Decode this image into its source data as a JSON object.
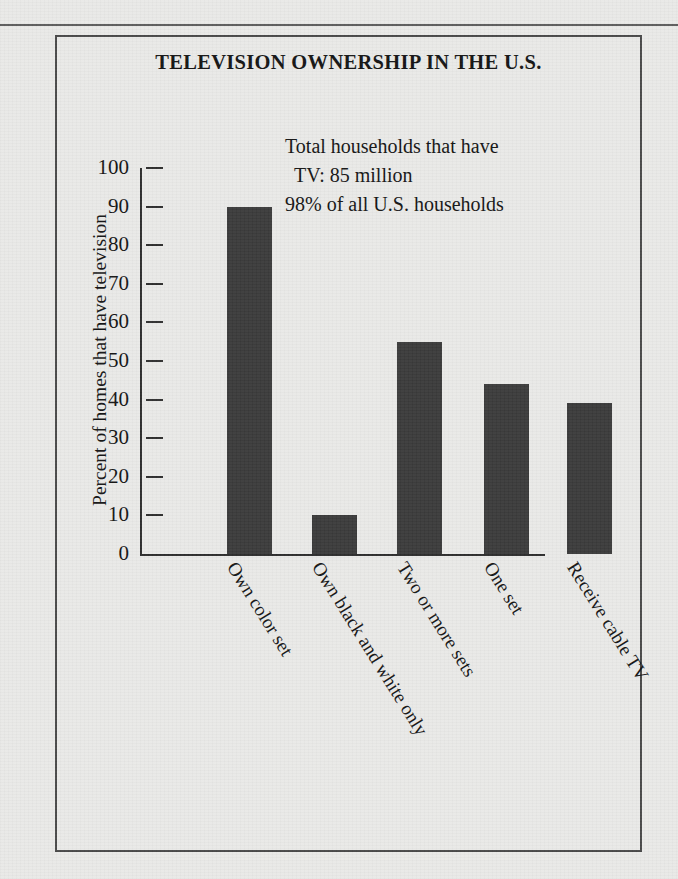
{
  "figure": {
    "title": "TELEVISION OWNERSHIP IN THE U.S.",
    "annotation": {
      "line1": "Total households that have",
      "line2": "TV: 85 million",
      "line3": "98% of all U.S. households"
    }
  },
  "chart_data": {
    "type": "bar",
    "title": "TELEVISION OWNERSHIP IN THE U.S.",
    "xlabel": "",
    "ylabel": "Percent of homes that have television",
    "ylim": [
      0,
      100
    ],
    "ytick_step": 10,
    "yticks": [
      "100",
      "90",
      "80",
      "70",
      "60",
      "50",
      "40",
      "30",
      "20",
      "10",
      "0"
    ],
    "grid": false,
    "legend": false,
    "bar_color": "#3a3a3a",
    "categories": [
      "Own color set",
      "Own black and white only",
      "Two or more sets",
      "One set",
      "Receive cable TV"
    ],
    "values": [
      90,
      10,
      55,
      44,
      39
    ],
    "annotations": [
      "Total households that have TV: 85 million",
      "98% of all U.S. households"
    ]
  },
  "colors": {
    "paper": "#e9e9e7",
    "ink": "#141414",
    "bar": "#3a3a3a",
    "axis": "#2e2e2e",
    "frame": "#4a4a4a"
  }
}
